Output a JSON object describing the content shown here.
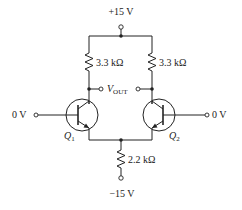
{
  "diagram": {
    "type": "differential-amplifier-circuit",
    "supply_positive": {
      "label": "+15 V"
    },
    "supply_negative": {
      "label": "−15 V"
    },
    "collector_resistors": [
      {
        "name": "left-collector-resistor",
        "label": "3.3 kΩ"
      },
      {
        "name": "right-collector-resistor",
        "label": "3.3 kΩ"
      }
    ],
    "emitter_resistor": {
      "label": "2.2 kΩ"
    },
    "output": {
      "label_main": "V",
      "label_sub": "OUT"
    },
    "transistors": [
      {
        "name": "Q1",
        "label_main": "Q",
        "label_sub": "1",
        "input_label": "0 V"
      },
      {
        "name": "Q2",
        "label_main": "Q",
        "label_sub": "2",
        "input_label": "0 V"
      }
    ]
  }
}
